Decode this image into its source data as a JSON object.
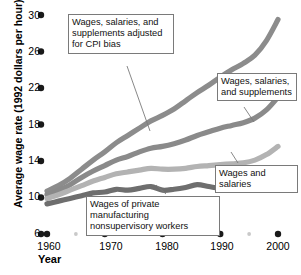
{
  "chart_data": {
    "type": "line",
    "title": "",
    "xlabel": "Year",
    "ylabel": "Average wage rate (1992 dollars per hour)",
    "xlim": [
      1958,
      2001
    ],
    "ylim": [
      6,
      30
    ],
    "xticks": [
      1960,
      1970,
      1980,
      1990,
      2000
    ],
    "xtick_labels": [
      "1960",
      "1970",
      "1980",
      "1990",
      "2000"
    ],
    "yticks": [
      6,
      10,
      14,
      18,
      22,
      26,
      30
    ],
    "ytick_labels": [
      "6",
      "10",
      "14",
      "18",
      "22",
      "26",
      "30"
    ],
    "minor_xticks": [
      1965,
      1975,
      1985,
      1995
    ],
    "grid": false,
    "legend_position": "inline-callouts",
    "series": [
      {
        "name": "Wages, salaries, and supplements adjusted for CPI bias",
        "color": "#8c8c8c",
        "x": [
          1960,
          1962,
          1964,
          1966,
          1968,
          1970,
          1972,
          1974,
          1976,
          1978,
          1980,
          1982,
          1984,
          1986,
          1988,
          1990,
          1992,
          1994,
          1996,
          1998,
          2000
        ],
        "values": [
          10.7,
          11.3,
          12.1,
          13.1,
          14.1,
          15.0,
          16.0,
          16.8,
          17.6,
          18.4,
          19.0,
          19.7,
          20.6,
          21.5,
          22.3,
          23.2,
          24.0,
          24.7,
          25.6,
          27.2,
          29.5
        ]
      },
      {
        "name": "Wages, salaries, and supplements",
        "color": "#8a8a8a",
        "x": [
          1960,
          1962,
          1964,
          1966,
          1968,
          1970,
          1972,
          1974,
          1976,
          1978,
          1980,
          1982,
          1984,
          1986,
          1988,
          1990,
          1992,
          1994,
          1996,
          1998,
          2000
        ],
        "values": [
          10.3,
          10.8,
          11.4,
          12.2,
          12.9,
          13.5,
          14.1,
          14.5,
          15.0,
          15.4,
          15.6,
          15.9,
          16.3,
          16.8,
          17.2,
          17.6,
          17.9,
          18.2,
          18.7,
          19.6,
          21.0
        ]
      },
      {
        "name": "Wages and salaries",
        "color": "#b3b3b3",
        "x": [
          1960,
          1962,
          1964,
          1966,
          1968,
          1970,
          1972,
          1974,
          1976,
          1978,
          1980,
          1982,
          1984,
          1986,
          1988,
          1990,
          1992,
          1994,
          1996,
          1998,
          2000
        ],
        "values": [
          9.9,
          10.3,
          10.8,
          11.3,
          11.8,
          12.2,
          12.6,
          12.8,
          13.0,
          13.2,
          13.1,
          13.1,
          13.2,
          13.4,
          13.5,
          13.6,
          13.7,
          13.8,
          14.1,
          14.7,
          15.6
        ]
      },
      {
        "name": "Wages of private manufacturing nonsupervisory workers",
        "color": "#6e6e6e",
        "x": [
          1960,
          1962,
          1964,
          1966,
          1968,
          1970,
          1972,
          1974,
          1976,
          1978,
          1980,
          1982,
          1984,
          1986,
          1988,
          1990,
          1992,
          1994,
          1996,
          1998,
          2000
        ],
        "values": [
          9.3,
          9.6,
          9.9,
          10.2,
          10.5,
          10.6,
          10.9,
          10.8,
          11.0,
          11.2,
          10.8,
          10.9,
          11.1,
          11.4,
          11.2,
          11.0,
          11.0,
          11.1,
          11.2,
          11.6,
          12.2
        ]
      }
    ],
    "callouts": [
      {
        "id": "callout-0",
        "text": "Wages, salaries, and\nsupplements adjusted\nfor CPI bias",
        "series_index": 0
      },
      {
        "id": "callout-1",
        "text": "Wages, salaries,\nand supplements",
        "series_index": 1
      },
      {
        "id": "callout-2",
        "text": "Wages and salaries",
        "series_index": 2
      },
      {
        "id": "callout-3",
        "text": "Wages of private manufacturing\nnonsupervisory workers",
        "series_index": 3
      }
    ]
  },
  "style": {
    "tick_dot_color": "#1a1a1a",
    "minor_tick_dot_color": "#c9c9c9",
    "callout_border": "#7a7a7a",
    "background": "#ffffff"
  }
}
